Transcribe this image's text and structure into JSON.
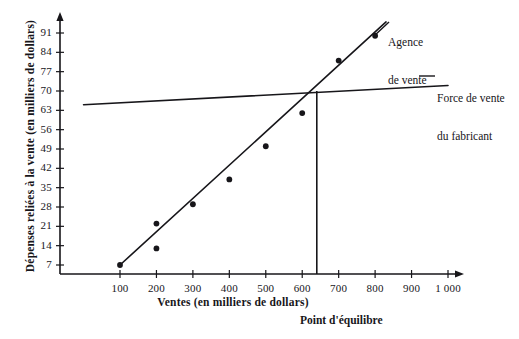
{
  "chart_data": {
    "type": "scatter",
    "title": "",
    "xlabel": "Ventes (en milliers de dollars)",
    "ylabel": "Dépenses reliées à la vente (en milliers de dollars)",
    "xlim": [
      0,
      1000
    ],
    "ylim": [
      0,
      95
    ],
    "grid": false,
    "legend_position": "inline-right",
    "x_ticks": [
      {
        "value": 100,
        "label": "100"
      },
      {
        "value": 200,
        "label": "200"
      },
      {
        "value": 300,
        "label": "300"
      },
      {
        "value": 400,
        "label": "400"
      },
      {
        "value": 500,
        "label": "500"
      },
      {
        "value": 600,
        "label": "600"
      },
      {
        "value": 700,
        "label": "700"
      },
      {
        "value": 800,
        "label": "800"
      },
      {
        "value": 900,
        "label": "900"
      },
      {
        "value": 1000,
        "label": "1 000"
      }
    ],
    "y_ticks": [
      {
        "value": 7,
        "label": "7"
      },
      {
        "value": 14,
        "label": "14"
      },
      {
        "value": 21,
        "label": "21"
      },
      {
        "value": 28,
        "label": "28"
      },
      {
        "value": 35,
        "label": "35"
      },
      {
        "value": 42,
        "label": "42"
      },
      {
        "value": 49,
        "label": "49"
      },
      {
        "value": 56,
        "label": "56"
      },
      {
        "value": 63,
        "label": "63"
      },
      {
        "value": 70,
        "label": "70"
      },
      {
        "value": 77,
        "label": "77"
      },
      {
        "value": 84,
        "label": "84"
      },
      {
        "value": 91,
        "label": "91"
      }
    ],
    "series": [
      {
        "name": "Agence de vente",
        "type": "scatter+line",
        "color": "#17161a",
        "points": [
          {
            "x": 100,
            "y": 7
          },
          {
            "x": 200,
            "y": 22
          },
          {
            "x": 200,
            "y": 13
          },
          {
            "x": 300,
            "y": 29
          },
          {
            "x": 400,
            "y": 38
          },
          {
            "x": 500,
            "y": 50
          },
          {
            "x": 600,
            "y": 62
          },
          {
            "x": 700,
            "y": 81
          },
          {
            "x": 800,
            "y": 90
          }
        ],
        "fit_line": {
          "x0": 100,
          "y0": 7,
          "x1": 830,
          "y1": 95
        }
      },
      {
        "name": "Force de vente du fabricant",
        "type": "line",
        "color": "#17161a",
        "fit_line": {
          "x0": 0,
          "y0": 65,
          "x1": 1000,
          "y1": 72
        }
      }
    ],
    "annotations": [
      {
        "name": "equilibrium-point",
        "label": "Point d'équilibre",
        "x": 640,
        "y": 70
      }
    ]
  },
  "labels": {
    "agency_line1": "Agence",
    "agency_line2": "de vente",
    "manufacturer_line1": "Force de vente",
    "manufacturer_line2": "du fabricant",
    "equilibrium": "Point d'équilibre",
    "x_axis_title": "Ventes (en milliers de dollars)",
    "y_axis_title": "Dépenses reliées à la vente (en milliers de dollars)"
  }
}
